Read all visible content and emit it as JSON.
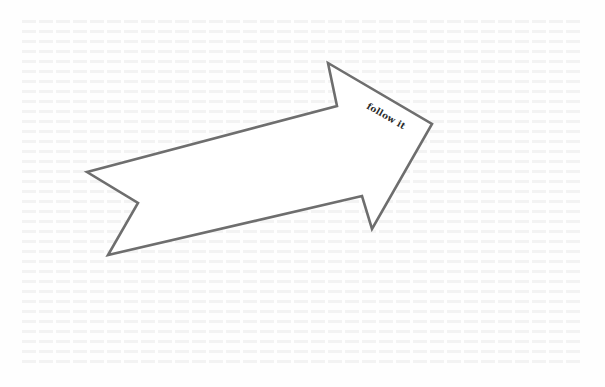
{
  "arrow": {
    "label": "follow it",
    "stroke_color": "#6e6e6e",
    "fill_color": "#ffffff"
  },
  "page": {
    "background_color": "#fefefe",
    "show_through_text": "illegible"
  }
}
